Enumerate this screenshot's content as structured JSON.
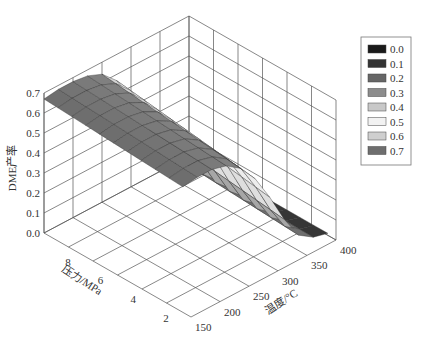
{
  "chart_data": {
    "type": "surface3d",
    "title": "",
    "xlabel": "温度/°C",
    "ylabel": "压力/MPa",
    "zlabel": "DME产率",
    "x_ticks": [
      "150",
      "200",
      "250",
      "300",
      "350",
      "400"
    ],
    "y_ticks": [
      "2",
      "4",
      "6",
      "8"
    ],
    "z_ticks": [
      "0.0",
      "0.1",
      "0.2",
      "0.3",
      "0.4",
      "0.5",
      "0.6",
      "0.7"
    ],
    "xlim": [
      150,
      400
    ],
    "ylim": [
      1,
      10
    ],
    "zlim": [
      0,
      0.7
    ],
    "legend": {
      "position": "upper right",
      "entries": [
        {
          "label": "0.0",
          "color": "#1a1a1a"
        },
        {
          "label": "0.1",
          "color": "#333333"
        },
        {
          "label": "0.2",
          "color": "#666666"
        },
        {
          "label": "0.3",
          "color": "#8c8c8c"
        },
        {
          "label": "0.4",
          "color": "#c8c8c8"
        },
        {
          "label": "0.5",
          "color": "#f2f2f2"
        },
        {
          "label": "0.6",
          "color": "#cfcfcf"
        },
        {
          "label": "0.7",
          "color": "#6e6e6e"
        }
      ]
    },
    "temperature": [
      150,
      175,
      200,
      225,
      250,
      275,
      300,
      325,
      350,
      375,
      400
    ],
    "pressure": [
      2,
      10
    ],
    "series": [
      {
        "name": "P=2MPa",
        "values": [
          0.63,
          0.64,
          0.64,
          0.62,
          0.57,
          0.48,
          0.35,
          0.2,
          0.08,
          0.03,
          0.01
        ]
      },
      {
        "name": "P=10MPa",
        "values": [
          0.67,
          0.68,
          0.68,
          0.67,
          0.64,
          0.57,
          0.45,
          0.28,
          0.12,
          0.04,
          0.01
        ]
      }
    ]
  }
}
